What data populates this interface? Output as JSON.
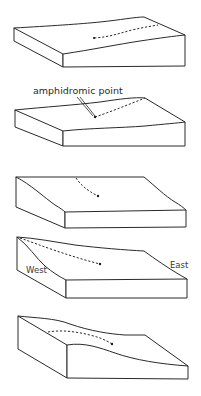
{
  "figure": {
    "panels": [
      {
        "id": 1,
        "label": ""
      },
      {
        "id": 2,
        "label": "amphidromic point"
      },
      {
        "id": 3,
        "label": ""
      },
      {
        "id": 4,
        "west_label": "West",
        "east_label": "East"
      },
      {
        "id": 5,
        "label": ""
      }
    ]
  }
}
